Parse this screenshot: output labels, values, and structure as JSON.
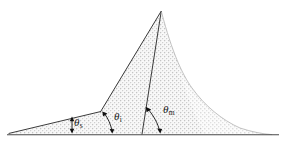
{
  "figure": {
    "name": "slope-angle-profile-diagram",
    "background_color": "#ffffff",
    "line_color": "#2b2b2b",
    "fill_color": "#e8e8e8",
    "stipple_color": "#bdbdbd",
    "baseline_color": "#555555",
    "labels": [
      {
        "id": "theta-s",
        "symbol": "θ",
        "subscript": "s",
        "description": "shallow outer slope angle at left toe"
      },
      {
        "id": "theta-i",
        "symbol": "θ",
        "subscript": "i",
        "description": "intermediate slope angle at kink vertex"
      },
      {
        "id": "theta-m",
        "symbol": "θ",
        "subscript": "m",
        "description": "maximum slope angle at inner base"
      }
    ],
    "geometry": {
      "baseline": {
        "x1": 8,
        "y1": 135,
        "x2": 278,
        "y2": 135
      },
      "apex": {
        "x": 161,
        "y": 11
      },
      "left_toe": {
        "x": 10,
        "y": 133
      },
      "kink_vertex": {
        "x": 100,
        "y": 112
      },
      "steep_base": {
        "x": 142,
        "y": 134
      },
      "right_toe": {
        "x": 272,
        "y": 134
      }
    },
    "angle_arcs": [
      {
        "id": "arc-theta-s",
        "vertex_x": 72,
        "vertex_y": 134,
        "arrowheads": 2
      },
      {
        "id": "arc-theta-i",
        "vertex_x": 112,
        "vertex_y": 134,
        "arrowheads": 2
      },
      {
        "id": "arc-theta-m",
        "vertex_x": 152,
        "vertex_y": 134,
        "arrowheads": 2
      }
    ]
  }
}
